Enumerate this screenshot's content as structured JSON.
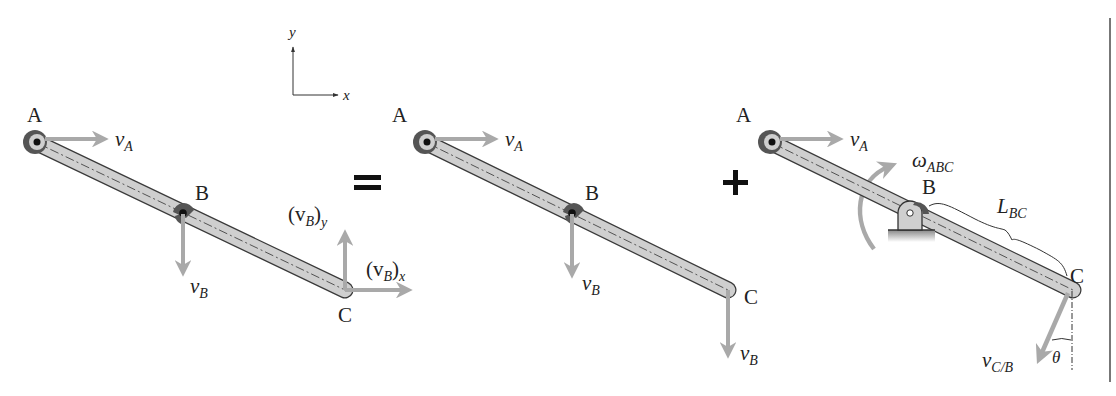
{
  "figure": {
    "colors": {
      "bar_fill": "#cfcfcf",
      "bar_stroke": "#3a3a3a",
      "vector": "#a9a9a9",
      "pin_dark": "#555555",
      "text": "#222222",
      "border": "#777777"
    },
    "axes": {
      "x_label": "x",
      "y_label": "y"
    },
    "operators": {
      "equals": "=",
      "plus": "+"
    },
    "panels": [
      {
        "name": "general-motion",
        "points": {
          "A": "A",
          "B": "B",
          "C": "C"
        },
        "vectors": {
          "vA": {
            "main": "v",
            "sub": "A"
          },
          "vB": {
            "main": "v",
            "sub": "B"
          },
          "vBy": {
            "open": "(v",
            "sub": "B",
            "close": ")",
            "sub2": "y"
          },
          "vBx": {
            "open": "(v",
            "sub": "B",
            "close": ")",
            "sub2": "x"
          }
        }
      },
      {
        "name": "translation",
        "points": {
          "A": "A",
          "B": "B",
          "C": "C"
        },
        "vectors": {
          "vA": {
            "main": "v",
            "sub": "A"
          },
          "vB": {
            "main": "v",
            "sub": "B"
          },
          "vC": {
            "main": "v",
            "sub": "B"
          }
        }
      },
      {
        "name": "rotation-about-B",
        "points": {
          "A": "A",
          "B": "B",
          "C": "C"
        },
        "vectors": {
          "vA": {
            "main": "v",
            "sub": "A"
          },
          "omega": {
            "main": "ω",
            "sub": "ABC"
          },
          "length": {
            "main": "L",
            "sub": "BC"
          },
          "vCB": {
            "main": "v",
            "sub": "C/B"
          },
          "angle": "θ"
        }
      }
    ]
  }
}
